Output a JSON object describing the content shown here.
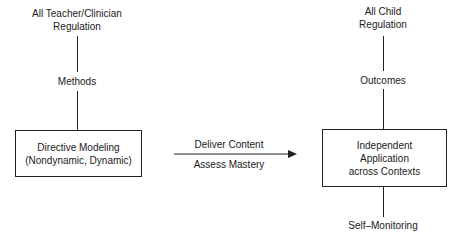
{
  "left_column": {
    "top_label_line1": "All Teacher/Clinician",
    "top_label_line2": "Regulation",
    "mid_label": "Methods",
    "box_line1": "Directive Modeling",
    "box_line2": "(Nondynamic, Dynamic)"
  },
  "arrow": {
    "label_above": "Deliver Content",
    "label_below": "Assess Mastery"
  },
  "right_column": {
    "top_label_line1": "All Child",
    "top_label_line2": "Regulation",
    "mid_label": "Outcomes",
    "box_line1": "Independent",
    "box_line2": "Application",
    "box_line3": "across Contexts",
    "bottom_label": "Self–Monitoring"
  }
}
